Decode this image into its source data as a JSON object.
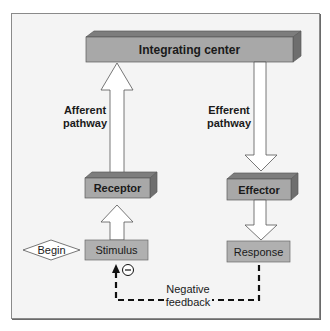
{
  "diagram": {
    "nodes": {
      "integrating_center": "Integrating center",
      "receptor": "Receptor",
      "effector": "Effector",
      "stimulus": "Stimulus",
      "response": "Response",
      "begin": "Begin"
    },
    "pathways": {
      "afferent_line1": "Afferent",
      "afferent_line2": "pathway",
      "efferent_line1": "Efferent",
      "efferent_line2": "pathway"
    },
    "feedback": {
      "line1": "Negative",
      "line2": "feedback",
      "sign": "−"
    },
    "edges": [
      {
        "from": "Begin",
        "to": "Stimulus",
        "style": "diamond-start"
      },
      {
        "from": "Stimulus",
        "to": "Receptor",
        "style": "hollow-arrow"
      },
      {
        "from": "Receptor",
        "to": "Integrating center",
        "style": "hollow-arrow",
        "label": "Afferent pathway"
      },
      {
        "from": "Integrating center",
        "to": "Effector",
        "style": "hollow-arrow",
        "label": "Efferent pathway"
      },
      {
        "from": "Effector",
        "to": "Response",
        "style": "hollow-arrow"
      },
      {
        "from": "Response",
        "to": "Stimulus",
        "style": "dashed-arrow",
        "label": "Negative feedback"
      }
    ],
    "colors": {
      "background": "#f4f4f4",
      "box_front": "#a8a8a8",
      "box_top": "#7d7d7d",
      "box_side": "#6e6e6e",
      "flat_box": "#b0b0b0",
      "arrow_fill": "#ffffff",
      "outline": "#555555"
    }
  }
}
